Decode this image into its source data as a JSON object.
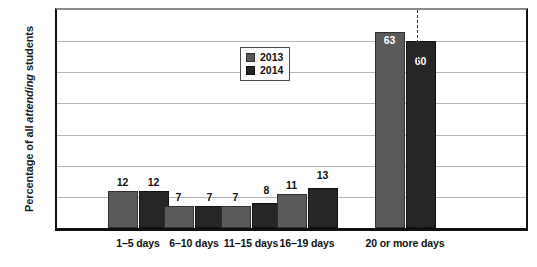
{
  "chart_data": {
    "type": "bar",
    "title": "",
    "xlabel": "",
    "ylabel": "Percentage of all attending students",
    "ylabel_plain_prefix": "Percentage of all ",
    "ylabel_italic_word": "attending",
    "ylabel_plain_suffix": " students",
    "ylim": [
      0,
      70
    ],
    "yticks": [
      0,
      10,
      20,
      30,
      40,
      50,
      60,
      70
    ],
    "grid": true,
    "grid_axis": "y",
    "legend_position": "upper-center",
    "categories": [
      "1–5 days",
      "6–10 days",
      "11–15 days",
      "16–19 days",
      "20 or more days"
    ],
    "series": [
      {
        "name": "2013",
        "color": "#5a5a5a",
        "values": [
          12,
          7,
          7,
          11,
          63
        ]
      },
      {
        "name": "2014",
        "color": "#262626",
        "values": [
          12,
          7,
          8,
          13,
          60
        ]
      }
    ],
    "bar_value_labels": {
      "2013": [
        "12",
        "7",
        "7",
        "11",
        "63"
      ],
      "2014": [
        "12",
        "7",
        "8",
        "13",
        "60"
      ],
      "label_inside_bar_categories": [
        "20 or more days"
      ]
    },
    "annotations": [
      {
        "text": "Low attenders",
        "position": "above-left-section"
      },
      {
        "text": "High attenders",
        "position": "above-right-section"
      }
    ],
    "divider": {
      "style": "dashed",
      "orientation": "vertical",
      "between": [
        "16–19 days",
        "20 or more days"
      ]
    }
  },
  "legend": {
    "items": [
      {
        "label": "2013",
        "color": "#5a5a5a"
      },
      {
        "label": "2014",
        "color": "#262626"
      }
    ]
  },
  "sections": {
    "low": "Low attenders",
    "high": "High attenders"
  },
  "colors": {
    "series_2013": "#5a5a5a",
    "series_2014": "#262626",
    "gridline": "#b5b5b5",
    "axis": "#111111",
    "text": "#1a1a1a"
  }
}
